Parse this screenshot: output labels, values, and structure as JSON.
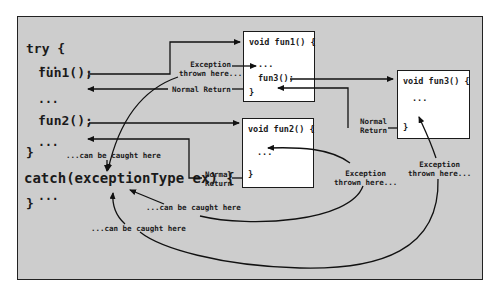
{
  "main": {
    "try_block": {
      "try_open": "try {",
      "dots1": "...",
      "call_fun1": "fun1();",
      "dots2": "...",
      "call_fun2": "fun2();",
      "dots3": "...",
      "close": "}",
      "catch_line": "catch(exceptionType ex) {",
      "catch_dots": "...",
      "catch_close": "}"
    },
    "fun1_box": {
      "signature": "void fun1() {",
      "dots": "...",
      "call_fun3": "fun3();",
      "close": "}"
    },
    "fun2_box": {
      "signature": "void fun2() {",
      "dots": "...",
      "close": "}"
    },
    "fun3_box": {
      "signature": "void fun3() {",
      "dots": "...",
      "close": "}"
    },
    "labels": {
      "exception_fun1": "Exception\nthrown here...",
      "normal_return_fun1": "Normal Return",
      "normal_return_fun3": "Normal\nReturn",
      "normal_return_fun2": "Normal\nReturn",
      "exception_fun2": "Exception\nthrown here...",
      "exception_fun3": "Exception\nthrown here...",
      "caught_here_1": "...can be caught here",
      "caught_here_2": "...can be caught here",
      "caught_here_3": "...can be caught here"
    }
  }
}
